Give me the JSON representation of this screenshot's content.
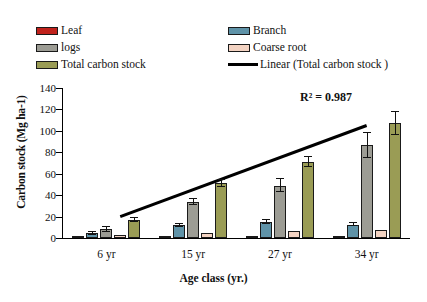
{
  "chart_data": {
    "type": "bar",
    "title": "",
    "xlabel": "Age class (yr.)",
    "ylabel": "Carbon stock (Mg ha-1)",
    "categories": [
      "6 yr",
      "15 yr",
      "27 yr",
      "34 yr"
    ],
    "ylim": [
      0,
      140
    ],
    "yticks": [
      0,
      20,
      40,
      60,
      80,
      100,
      120,
      140
    ],
    "grid": false,
    "legend_position": "top",
    "annotations": [
      {
        "text": "R² = 0.987",
        "x": "34 yr",
        "y": 133
      }
    ],
    "series": [
      {
        "name": "Leaf",
        "color": "#c0221c",
        "values": [
          1.0,
          1.5,
          1.5,
          2.0
        ],
        "errors": [
          0,
          0,
          0,
          0
        ]
      },
      {
        "name": "Branch",
        "color": "#5f93a8",
        "values": [
          4.5,
          12.0,
          15.0,
          12.5
        ],
        "errors": [
          1.5,
          1.5,
          1.5,
          1.5
        ]
      },
      {
        "name": "logs",
        "color": "#9c9c94",
        "values": [
          8.0,
          33.5,
          49.0,
          86.5
        ],
        "errors": [
          2.0,
          2.5,
          6.0,
          11.5
        ]
      },
      {
        "name": "Coarse root",
        "color": "#f3d3c2",
        "values": [
          2.5,
          5.0,
          6.5,
          7.5
        ],
        "errors": [
          0,
          0,
          0,
          0
        ]
      },
      {
        "name": "Total carbon stock",
        "color": "#9a9c55",
        "values": [
          16.5,
          51.0,
          71.0,
          107.0
        ],
        "errors": [
          2.0,
          3.0,
          5.0,
          11.0
        ]
      }
    ],
    "trendline": {
      "name": "Linear (Total carbon stock )",
      "color": "#000000",
      "x_start_frac": 0.165,
      "x_end_frac": 0.875,
      "y_start": 20.0,
      "y_end": 105.0
    }
  },
  "legend": {
    "items": [
      {
        "label": "Leaf",
        "type": "swatch",
        "color": "#c0221c",
        "col": 0,
        "row": 0
      },
      {
        "label": "Branch",
        "type": "swatch",
        "color": "#5f93a8",
        "col": 1,
        "row": 0
      },
      {
        "label": "logs",
        "type": "swatch",
        "color": "#9c9c94",
        "col": 0,
        "row": 1
      },
      {
        "label": "Coarse root",
        "type": "swatch",
        "color": "#f3d3c2",
        "col": 1,
        "row": 1
      },
      {
        "label": "Total carbon stock",
        "type": "swatch",
        "color": "#9a9c55",
        "col": 0,
        "row": 2
      },
      {
        "label": "Linear (Total carbon stock )",
        "type": "line",
        "color": "#000000",
        "col": 1,
        "row": 2
      }
    ]
  },
  "axes": {
    "y_title": "Carbon stock (Mg ha-1)",
    "x_title": "Age class (yr.)",
    "y_tick_labels": [
      "140",
      "120",
      "100",
      "80",
      "60",
      "40",
      "20",
      "0"
    ],
    "x_tick_labels": [
      "6 yr",
      "15 yr",
      "27 yr",
      "34 yr"
    ]
  },
  "annotation": {
    "r2": "R² = 0.987"
  }
}
